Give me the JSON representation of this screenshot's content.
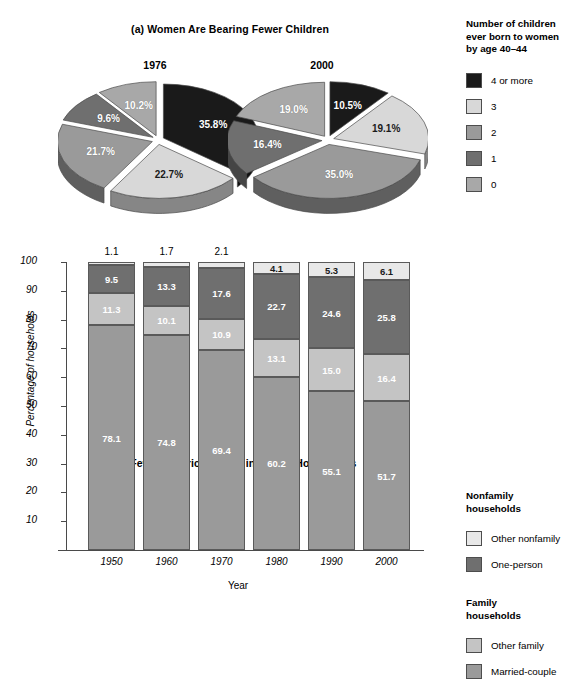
{
  "panel_a": {
    "title": "(a) Women Are Bearing Fewer Children",
    "legend_title_line1": "Number of children",
    "legend_title_line2": "ever born to women",
    "legend_title_line3": "by age 40–44",
    "legend": [
      {
        "label": "4 or more",
        "color": "#1a1a1a"
      },
      {
        "label": "3",
        "color": "#d8d8d8"
      },
      {
        "label": "2",
        "color": "#9a9a9a"
      },
      {
        "label": "1",
        "color": "#6f6f6f"
      },
      {
        "label": "0",
        "color": "#a8a8a8"
      }
    ]
  },
  "panel_b": {
    "title": "(b) Fewer Americans Live in Family Households",
    "xlabel": "Year",
    "ylabel": "Percentage of households",
    "legend_group_1_line1": "Nonfamily",
    "legend_group_1_line2": "households",
    "legend_group_2_line1": "Family",
    "legend_group_2_line2": "households",
    "legend": [
      {
        "label": "Other nonfamily",
        "color": "#e8e8e8"
      },
      {
        "label": "One-person",
        "color": "#6f6f6f"
      },
      {
        "label": "Other family",
        "color": "#c4c4c4"
      },
      {
        "label": "Married-couple",
        "color": "#9a9a9a"
      }
    ]
  },
  "chart_data": [
    {
      "type": "pie",
      "title": "1976",
      "subtitle": "(a) Women Are Bearing Fewer Children",
      "legend_title": "Number of children ever born to women by age 40–44",
      "categories": [
        "4 or more",
        "3",
        "2",
        "1",
        "0"
      ],
      "values": [
        35.8,
        22.7,
        21.7,
        9.6,
        10.2
      ],
      "labels": [
        "35.8%",
        "22.7%",
        "21.7%",
        "9.6%",
        "10.2%"
      ],
      "colors": [
        "#1a1a1a",
        "#d8d8d8",
        "#9a9a9a",
        "#6f6f6f",
        "#a8a8a8"
      ],
      "exploded": true,
      "three_d": true
    },
    {
      "type": "pie",
      "title": "2000",
      "subtitle": "(a) Women Are Bearing Fewer Children",
      "legend_title": "Number of children ever born to women by age 40–44",
      "categories": [
        "4 or more",
        "3",
        "2",
        "1",
        "0"
      ],
      "values": [
        10.5,
        19.1,
        35.0,
        16.4,
        19.0
      ],
      "labels": [
        "10.5%",
        "19.1%",
        "35.0%",
        "16.4%",
        "19.0%"
      ],
      "colors": [
        "#1a1a1a",
        "#d8d8d8",
        "#9a9a9a",
        "#6f6f6f",
        "#a8a8a8"
      ],
      "exploded": true,
      "three_d": true
    },
    {
      "type": "bar",
      "stacked": true,
      "title": "(b) Fewer Americans Live in Family Households",
      "xlabel": "Year",
      "ylabel": "Percentage of households",
      "categories": [
        "1950",
        "1960",
        "1970",
        "1980",
        "1990",
        "2000"
      ],
      "ylim": [
        0,
        100
      ],
      "yticks": [
        10,
        20,
        30,
        40,
        50,
        60,
        70,
        80,
        90,
        100
      ],
      "grid": false,
      "legend_position": "right",
      "series": [
        {
          "name": "Married-couple",
          "color": "#9a9a9a",
          "values": [
            78.1,
            74.8,
            69.4,
            60.2,
            55.1,
            51.7
          ]
        },
        {
          "name": "Other family",
          "color": "#c4c4c4",
          "values": [
            11.3,
            10.1,
            10.9,
            13.1,
            15.0,
            16.4
          ]
        },
        {
          "name": "One-person",
          "color": "#6f6f6f",
          "values": [
            9.5,
            13.3,
            17.6,
            22.7,
            24.6,
            25.8
          ]
        },
        {
          "name": "Other nonfamily",
          "color": "#e8e8e8",
          "values": [
            1.1,
            1.7,
            2.1,
            4.1,
            5.3,
            6.1
          ]
        }
      ]
    }
  ]
}
